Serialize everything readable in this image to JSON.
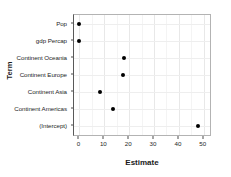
{
  "chart_data": {
    "type": "scatter",
    "title": "",
    "xlabel": "Estimate",
    "ylabel": "Term",
    "xlim": [
      -2.2,
      52.5
    ],
    "ylim": [
      0,
      7
    ],
    "grid": true,
    "legend": false,
    "x_ticks": [
      0,
      10,
      20,
      30,
      40,
      50
    ],
    "x_tick_labels": [
      "0",
      "10",
      "20",
      "30",
      "40",
      "50"
    ],
    "x_minor_ticks": [
      5,
      15,
      25,
      35,
      45
    ],
    "categories": [
      "Pop",
      "gdp Percap",
      "Continent Oceania",
      "Continent Europe",
      "Continent Asia",
      "Continent Americas",
      "(Intercept)"
    ],
    "values": [
      0.0,
      0.0,
      17.8,
      17.4,
      8.3,
      13.5,
      47.7
    ],
    "points": [
      {
        "term": "Pop",
        "estimate": 0.0
      },
      {
        "term": "gdp Percap",
        "estimate": 0.0
      },
      {
        "term": "Continent Oceania",
        "estimate": 17.8
      },
      {
        "term": "Continent Europe",
        "estimate": 17.4
      },
      {
        "term": "Continent Asia",
        "estimate": 8.3
      },
      {
        "term": "Continent Americas",
        "estimate": 13.5
      },
      {
        "term": "(Intercept)",
        "estimate": 47.7
      }
    ],
    "marker_color": "#000000",
    "panel_border_color": "#b3b3b3",
    "grid_color": "#e8e8e8",
    "background_color": "#ffffff"
  }
}
